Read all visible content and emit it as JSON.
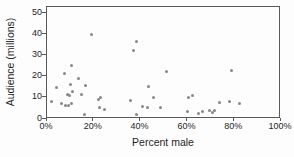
{
  "chart_data": {
    "type": "scatter",
    "title": "",
    "xlabel": "Percent male",
    "ylabel": "Audience (millions)",
    "xlim": [
      0,
      100
    ],
    "ylim": [
      0,
      50
    ],
    "x_ticks": [
      0,
      20,
      40,
      60,
      80,
      100
    ],
    "x_tick_labels": [
      "0%",
      "20%",
      "40%",
      "60%",
      "80%",
      "100%"
    ],
    "y_ticks": [
      0,
      10,
      20,
      30,
      40,
      50
    ],
    "y_tick_labels": [
      "0",
      "10",
      "20",
      "30",
      "40",
      "50"
    ],
    "grid": false,
    "legend_position": "none",
    "marker_color": "#878787",
    "marker_size_px": 3,
    "axis_color": "#5a5a5a",
    "text_color": "#1f1f1f",
    "points": [
      [
        19.3,
        39.4
      ],
      [
        10.7,
        25.0
      ],
      [
        8.0,
        21.0
      ],
      [
        14.0,
        18.7
      ],
      [
        10.5,
        15.8
      ],
      [
        16.7,
        15.5
      ],
      [
        4.5,
        14.2
      ],
      [
        11.3,
        12.6
      ],
      [
        9.2,
        11.3
      ],
      [
        10.2,
        10.7
      ],
      [
        15.0,
        11.2
      ],
      [
        2.5,
        7.9
      ],
      [
        6.8,
        6.7
      ],
      [
        8.3,
        5.9
      ],
      [
        9.5,
        5.9
      ],
      [
        11.0,
        6.9
      ],
      [
        16.5,
        1.5
      ],
      [
        22.3,
        8.8
      ],
      [
        23.4,
        9.9
      ],
      [
        22.7,
        5.1
      ],
      [
        25.2,
        4.0
      ],
      [
        36.3,
        8.3
      ],
      [
        37.5,
        31.8
      ],
      [
        38.6,
        36.3
      ],
      [
        38.6,
        1.7
      ],
      [
        41.1,
        5.6
      ],
      [
        43.2,
        4.9
      ],
      [
        44.0,
        14.7
      ],
      [
        46.1,
        9.6
      ],
      [
        48.9,
        5.1
      ],
      [
        51.4,
        22.0
      ],
      [
        60.4,
        3.2
      ],
      [
        60.7,
        9.6
      ],
      [
        62.6,
        10.4
      ],
      [
        65.0,
        2.1
      ],
      [
        66.9,
        3.1
      ],
      [
        70.0,
        3.7
      ],
      [
        71.2,
        2.6
      ],
      [
        72.2,
        3.4
      ],
      [
        74.3,
        7.4
      ],
      [
        78.6,
        7.9
      ],
      [
        79.4,
        22.3
      ],
      [
        82.7,
        6.9
      ]
    ]
  }
}
